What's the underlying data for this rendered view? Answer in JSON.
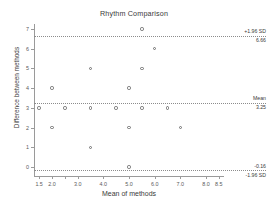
{
  "chart_data": {
    "type": "scatter",
    "title": "Rhythm Comparison",
    "xlabel": "Mean of methods",
    "ylabel": "Difference between methods",
    "xlim": [
      1.3,
      8.7
    ],
    "ylim": [
      -0.45,
      7.25
    ],
    "grid": false,
    "legend": "none",
    "xticks": [
      {
        "value": 1.5,
        "label": "1.5"
      },
      {
        "value": 2.0,
        "label": "2.0"
      },
      {
        "value": 2.5,
        "label": ""
      },
      {
        "value": 3.0,
        "label": "3.0"
      },
      {
        "value": 4.0,
        "label": "4.0"
      },
      {
        "value": 5.0,
        "label": "5.0"
      },
      {
        "value": 6.0,
        "label": "6.0"
      },
      {
        "value": 7.0,
        "label": "7.0"
      },
      {
        "value": 8.0,
        "label": "8.0"
      },
      {
        "value": 8.5,
        "label": "8.5"
      }
    ],
    "yticks": [
      {
        "value": 0,
        "label": "0"
      },
      {
        "value": 1,
        "label": "1"
      },
      {
        "value": 2,
        "label": "2"
      },
      {
        "value": 3,
        "label": "3"
      },
      {
        "value": 4,
        "label": "4"
      },
      {
        "value": 5,
        "label": "5"
      },
      {
        "value": 6,
        "label": "6"
      },
      {
        "value": 7,
        "label": "7"
      }
    ],
    "reference_lines": [
      {
        "id": "upper-loa",
        "name": "+1.96 SD",
        "value": 6.66,
        "value_label": "6.66",
        "name_position": "above",
        "style": "dotted"
      },
      {
        "id": "mean",
        "name": "Mean",
        "value": 3.25,
        "value_label": "3.25",
        "name_position": "above",
        "style": "dotted"
      },
      {
        "id": "lower-loa",
        "name": "-1.96 SD",
        "value": -0.16,
        "value_label": "-0.16",
        "name_position": "below",
        "style": "dotted"
      }
    ],
    "points": [
      {
        "x": 5.5,
        "y": 7
      },
      {
        "x": 6.0,
        "y": 6
      },
      {
        "x": 3.5,
        "y": 5
      },
      {
        "x": 5.5,
        "y": 5
      },
      {
        "x": 2.0,
        "y": 4
      },
      {
        "x": 5.0,
        "y": 4
      },
      {
        "x": 1.5,
        "y": 3
      },
      {
        "x": 2.5,
        "y": 3
      },
      {
        "x": 3.5,
        "y": 3
      },
      {
        "x": 4.5,
        "y": 3
      },
      {
        "x": 5.5,
        "y": 3
      },
      {
        "x": 6.5,
        "y": 3
      },
      {
        "x": 2.0,
        "y": 2
      },
      {
        "x": 5.0,
        "y": 2
      },
      {
        "x": 7.0,
        "y": 2
      },
      {
        "x": 3.5,
        "y": 1
      },
      {
        "x": 5.0,
        "y": 0
      }
    ]
  },
  "colors": {
    "axis": "#9a9a9a",
    "point_stroke": "#6f6f6f",
    "reference_line": "#8c8c8c",
    "text": "#3a3a3a",
    "tick_text": "#5a5a5a",
    "background": "#ffffff"
  }
}
